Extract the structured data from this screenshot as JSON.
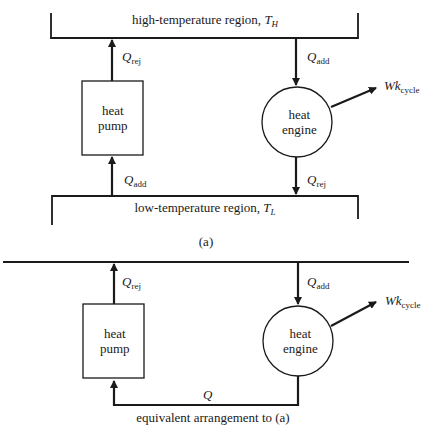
{
  "diagram_a": {
    "high_region": {
      "text": "high-temperature region, ",
      "symbol": "T",
      "subscript": "H"
    },
    "low_region": {
      "text": "low-temperature region, ",
      "symbol": "T",
      "subscript": "L"
    },
    "heat_pump": {
      "line1": "heat",
      "line2": "pump"
    },
    "heat_engine": {
      "line1": "heat",
      "line2": "engine"
    },
    "pump_top_flow": {
      "symbol": "Q",
      "subscript": "rej"
    },
    "pump_bottom_flow": {
      "symbol": "Q",
      "subscript": "add"
    },
    "engine_top_flow": {
      "symbol": "Q",
      "subscript": "add"
    },
    "engine_bottom_flow": {
      "symbol": "Q",
      "subscript": "rej"
    },
    "work_output": {
      "symbol": "Wk",
      "subscript": "cycle"
    },
    "caption": "(a)"
  },
  "diagram_b": {
    "heat_pump": {
      "line1": "heat",
      "line2": "pump"
    },
    "heat_engine": {
      "line1": "heat",
      "line2": "engine"
    },
    "pump_top_flow": {
      "symbol": "Q",
      "subscript": "rej"
    },
    "engine_top_flow": {
      "symbol": "Q",
      "subscript": "add"
    },
    "loop_flow": {
      "symbol": "Q"
    },
    "work_output": {
      "symbol": "Wk",
      "subscript": "cycle"
    },
    "caption": "equivalent arrangement to (a)"
  },
  "colors": {
    "ink": "#1a1a1a",
    "background": "#ffffff"
  }
}
